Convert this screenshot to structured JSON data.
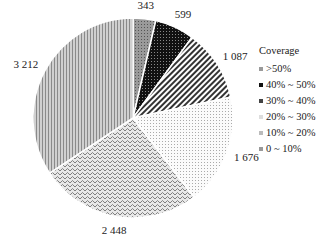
{
  "chart_data": {
    "type": "pie",
    "title": "",
    "legend_title": "Coverage",
    "legend_position": "right",
    "categories": [
      ">50%",
      "40% ~ 50%",
      "30% ~ 40%",
      "20% ~ 30%",
      "10% ~ 20%",
      "0 ~ 10%"
    ],
    "values": [
      343,
      599,
      1087,
      1676,
      2448,
      3212
    ],
    "value_labels": [
      "343",
      "599",
      "1 087",
      "1 676",
      "2 448",
      "3 212"
    ]
  },
  "legend": {
    "title": "Coverage",
    "items": [
      {
        "label": ">50%"
      },
      {
        "label": "40% ~ 50%"
      },
      {
        "label": "30% ~ 40%"
      },
      {
        "label": "20% ~ 30%"
      },
      {
        "label": "10% ~ 20%"
      },
      {
        "label": "0 ~ 10%"
      }
    ]
  }
}
